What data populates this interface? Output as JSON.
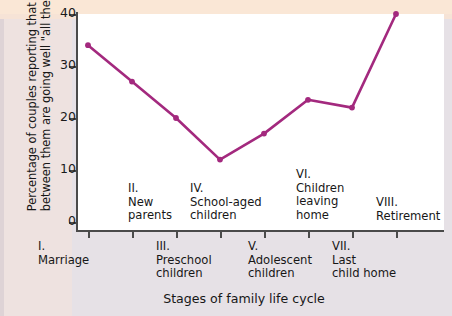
{
  "chart_data": {
    "type": "line",
    "title": "",
    "xlabel": "Stages of family life cycle",
    "ylabel": "Percentage of couples reporting that things between them are going well \"all the time\"",
    "ylabel_lines": [
      "Percentage of couples reporting that things",
      "between them are going well \"all the time\""
    ],
    "categories": [
      "I.\nMarriage",
      "II.\nNew\nparents",
      "III.\nPreschool\nchildren",
      "IV.\nSchool-aged\nchildren",
      "V.\nAdolescent\nchildren",
      "VI.\nChildren\nleaving\nhome",
      "VII.\nLast\nchild home",
      "VIII.\nRetirement"
    ],
    "stages": [
      {
        "numeral": "I.",
        "name": "Marriage",
        "position": "below",
        "value": 34
      },
      {
        "numeral": "II.",
        "name": "New parents",
        "position": "above",
        "value": 27
      },
      {
        "numeral": "III.",
        "name": "Preschool children",
        "position": "below",
        "value": 20
      },
      {
        "numeral": "IV.",
        "name": "School-aged children",
        "position": "above",
        "value": 12
      },
      {
        "numeral": "V.",
        "name": "Adolescent children",
        "position": "below",
        "value": 17
      },
      {
        "numeral": "VI.",
        "name": "Children leaving home",
        "position": "above",
        "value": 23.5
      },
      {
        "numeral": "VII.",
        "name": "Last child home",
        "position": "below",
        "value": 22
      },
      {
        "numeral": "VIII.",
        "name": "Retirement",
        "position": "above",
        "value": 40
      }
    ],
    "values": [
      34,
      27,
      20,
      12,
      17,
      23.5,
      22,
      40
    ],
    "ylim": [
      0,
      40
    ],
    "yticks": [
      0,
      10,
      20,
      30,
      40
    ],
    "ytick_labels": [
      "0",
      "10",
      "20",
      "30",
      "40"
    ],
    "grid": false,
    "legend": null,
    "series_color": "#a3297e",
    "marker": "circle"
  },
  "axis": {
    "y_tick_labels": [
      "40",
      "30",
      "20",
      "10",
      "0"
    ]
  },
  "stage_text": {
    "s1": "I.\nMarriage",
    "s2": "II.\nNew\nparents",
    "s3": "III.\nPreschool\nchildren",
    "s4": "IV.\nSchool-aged\nchildren",
    "s5": "V.\nAdolescent\nchildren",
    "s6": "VI.\nChildren\nleaving\nhome",
    "s7": "VII.\nLast\nchild home",
    "s8": "VIII.\nRetirement"
  },
  "titles": {
    "x_axis": "Stages of family life cycle",
    "y_axis_line1": "Percentage of couples reporting that things",
    "y_axis_line2": "between them are going well \"all the time\""
  }
}
